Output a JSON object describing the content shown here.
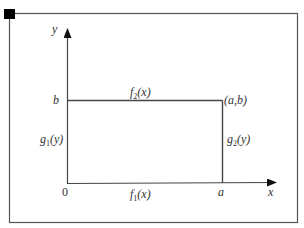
{
  "diagram": {
    "axes": {
      "x_label": "x",
      "y_label": "y"
    },
    "points": {
      "origin": "0",
      "a": "a",
      "b": "b",
      "corner": "(a,b)"
    },
    "edges": {
      "bottom": {
        "name": "f",
        "sub": "1",
        "arg": "(x)"
      },
      "top": {
        "name": "f",
        "sub": "2",
        "arg": "(x)"
      },
      "left": {
        "name": "g",
        "sub": "1",
        "arg": "(y)"
      },
      "right": {
        "name": "g",
        "sub": "2",
        "arg": "(y)"
      }
    },
    "colors": {
      "line": "#444444",
      "marker": "#000000",
      "background": "#ffffff"
    }
  }
}
